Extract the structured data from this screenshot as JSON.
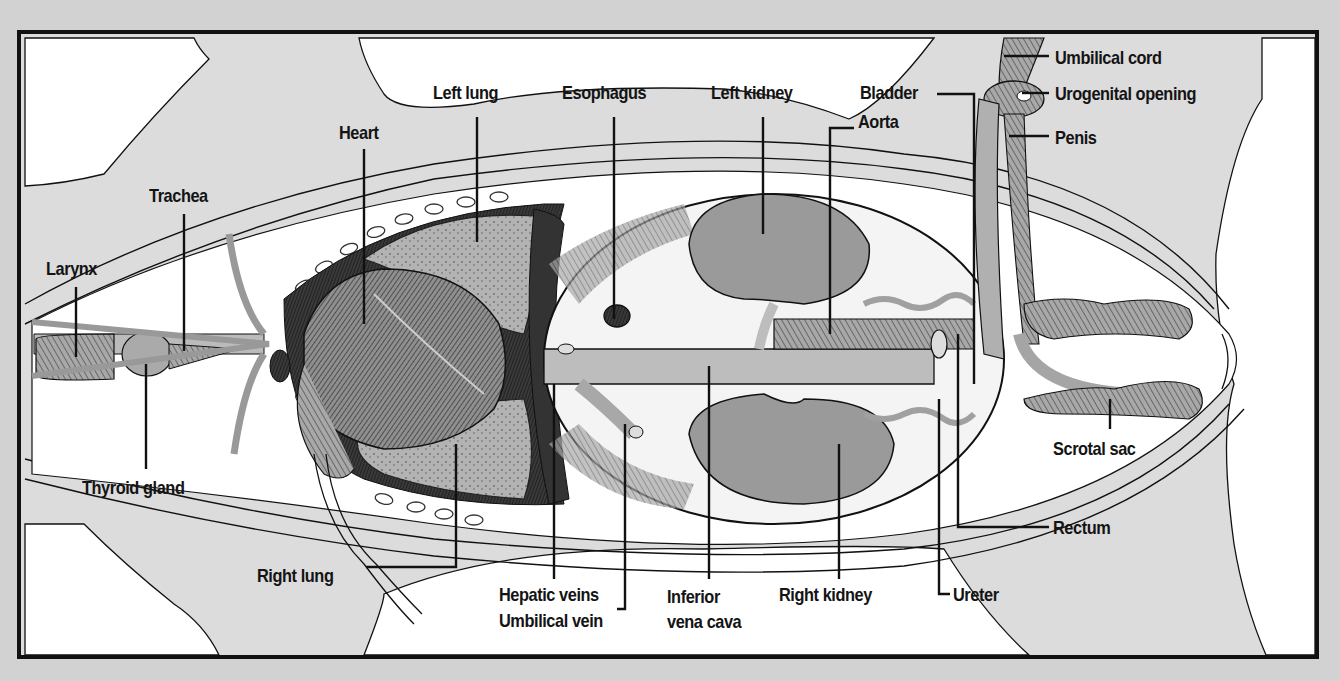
{
  "diagram": {
    "colors": {
      "background": "#d2d2d2",
      "frame": "#111111",
      "skin_gray": "#dcdcdc",
      "cavity_white": "#ffffff",
      "organ_gray": "#9a9a9a",
      "vessel_gray": "#b4b4b4",
      "line": "#111111"
    },
    "labels": {
      "larynx": "Larynx",
      "trachea": "Trachea",
      "thyroid_gland": "Thyroid gland",
      "heart": "Heart",
      "left_lung": "Left lung",
      "right_lung": "Right lung",
      "esophagus": "Esophagus",
      "hepatic_veins": "Hepatic veins",
      "umbilical_vein": "Umbilical vein",
      "inferior_vena_cava": "Inferior\nvena cava",
      "left_kidney": "Left kidney",
      "right_kidney": "Right kidney",
      "aorta": "Aorta",
      "bladder": "Bladder",
      "umbilical_cord": "Umbilical cord",
      "urogenital_opening": "Urogenital opening",
      "penis": "Penis",
      "scrotal_sac": "Scrotal sac",
      "rectum": "Rectum",
      "ureter": "Ureter"
    }
  }
}
